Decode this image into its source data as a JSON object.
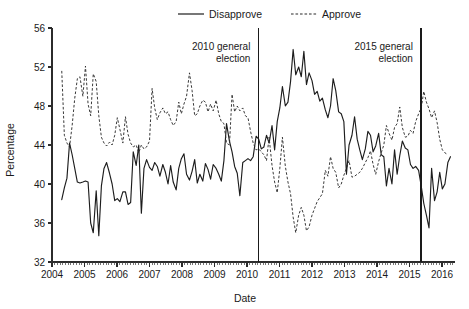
{
  "chart_data": {
    "type": "line",
    "title": "",
    "xlabel": "Date",
    "ylabel": "Percentage",
    "ylim": [
      32,
      56
    ],
    "ytick_step": 4,
    "yticks": [
      "32",
      "36",
      "40",
      "44",
      "48",
      "52",
      "56"
    ],
    "xlim": [
      2004,
      2016.4
    ],
    "xticks": [
      "2004",
      "2005",
      "2006",
      "2007",
      "2008",
      "2009",
      "2010",
      "2011",
      "2012",
      "2013",
      "2014",
      "2015",
      "2016"
    ],
    "grid": false,
    "legend_position": "top-center",
    "minor_ticks": "monthly",
    "annotations": [
      {
        "label_line1": "2010 general",
        "label_line2": "election",
        "x": 2010.35
      },
      {
        "label_line1": "2015 general",
        "label_line2": "election",
        "x": 2015.35
      }
    ],
    "series": [
      {
        "name": "Disapprove",
        "style": "solid",
        "color": "#1d1d1d",
        "x": [
          2004.3,
          2004.38,
          2004.46,
          2004.54,
          2004.62,
          2004.7,
          2004.78,
          2004.86,
          2004.95,
          2005.03,
          2005.11,
          2005.19,
          2005.27,
          2005.36,
          2005.44,
          2005.52,
          2005.6,
          2005.68,
          2005.77,
          2005.85,
          2005.93,
          2006.01,
          2006.09,
          2006.18,
          2006.26,
          2006.34,
          2006.42,
          2006.5,
          2006.59,
          2006.67,
          2006.75,
          2006.83,
          2006.91,
          2007.0,
          2007.08,
          2007.16,
          2007.24,
          2007.32,
          2007.41,
          2007.49,
          2007.57,
          2007.65,
          2007.73,
          2007.82,
          2007.9,
          2007.98,
          2008.06,
          2008.14,
          2008.23,
          2008.31,
          2008.39,
          2008.47,
          2008.55,
          2008.64,
          2008.72,
          2008.8,
          2008.88,
          2008.96,
          2009.05,
          2009.13,
          2009.21,
          2009.29,
          2009.37,
          2009.46,
          2009.54,
          2009.62,
          2009.7,
          2009.78,
          2009.87,
          2009.95,
          2010.03,
          2010.11,
          2010.19,
          2010.28,
          2010.36,
          2010.44,
          2010.52,
          2010.6,
          2010.68,
          2010.77,
          2010.85,
          2010.93,
          2011.01,
          2011.09,
          2011.18,
          2011.26,
          2011.34,
          2011.42,
          2011.5,
          2011.59,
          2011.67,
          2011.75,
          2011.83,
          2011.91,
          2012.0,
          2012.08,
          2012.16,
          2012.24,
          2012.32,
          2012.41,
          2012.49,
          2012.57,
          2012.65,
          2012.73,
          2012.82,
          2012.9,
          2012.98,
          2013.06,
          2013.14,
          2013.23,
          2013.31,
          2013.39,
          2013.47,
          2013.55,
          2013.64,
          2013.72,
          2013.8,
          2013.88,
          2013.96,
          2014.05,
          2014.13,
          2014.21,
          2014.29,
          2014.37,
          2014.46,
          2014.54,
          2014.62,
          2014.7,
          2014.78,
          2014.87,
          2014.95,
          2015.03,
          2015.11,
          2015.19,
          2015.28,
          2015.36,
          2015.44,
          2015.52,
          2015.6,
          2015.68,
          2015.77,
          2015.85,
          2015.93,
          2016.01,
          2016.09,
          2016.18,
          2016.26
        ],
        "y": [
          38.4,
          39.6,
          40.6,
          44.2,
          43.0,
          41.6,
          40.2,
          40.1,
          40.2,
          40.3,
          40.2,
          36.0,
          35.0,
          39.3,
          34.7,
          39.8,
          41.6,
          42.2,
          41.1,
          40.0,
          38.3,
          38.5,
          38.2,
          39.2,
          39.2,
          37.9,
          38.1,
          43.3,
          41.9,
          44.0,
          37.0,
          41.6,
          42.5,
          41.7,
          41.4,
          42.2,
          41.8,
          40.8,
          42.0,
          41.2,
          40.0,
          41.9,
          40.2,
          39.4,
          41.6,
          42.6,
          43.1,
          41.0,
          40.4,
          41.3,
          42.5,
          40.1,
          41.0,
          40.3,
          42.1,
          41.5,
          40.5,
          42.0,
          41.6,
          41.0,
          40.3,
          42.4,
          46.2,
          44.4,
          43.3,
          41.8,
          41.1,
          38.8,
          42.2,
          42.4,
          42.6,
          42.4,
          42.8,
          44.9,
          44.6,
          43.6,
          43.8,
          45.0,
          44.2,
          46.0,
          43.5,
          46.4,
          47.8,
          50.0,
          48.0,
          48.4,
          50.5,
          53.8,
          51.2,
          52.0,
          51.0,
          53.6,
          50.2,
          51.4,
          50.6,
          49.2,
          49.5,
          48.5,
          48.8,
          47.6,
          46.8,
          48.0,
          50.8,
          49.6,
          47.4,
          47.2,
          46.4,
          41.0,
          44.0,
          45.0,
          46.9,
          44.6,
          43.5,
          42.5,
          43.6,
          45.4,
          45.0,
          43.3,
          43.9,
          45.2,
          43.0,
          42.8,
          39.8,
          41.6,
          40.0,
          43.5,
          41.0,
          42.9,
          44.4,
          43.7,
          43.5,
          42.0,
          41.6,
          41.8,
          41.4,
          39.8,
          38.0,
          36.8,
          35.5,
          41.6,
          38.3,
          39.2,
          41.2,
          39.5,
          40.0,
          42.2,
          42.8
        ]
      },
      {
        "name": "Approve",
        "style": "dashed",
        "color": "#2e2e2e",
        "x": [
          2004.3,
          2004.38,
          2004.46,
          2004.54,
          2004.62,
          2004.7,
          2004.78,
          2004.86,
          2004.95,
          2005.03,
          2005.11,
          2005.19,
          2005.27,
          2005.36,
          2005.44,
          2005.52,
          2005.6,
          2005.68,
          2005.77,
          2005.85,
          2005.93,
          2006.01,
          2006.09,
          2006.18,
          2006.26,
          2006.34,
          2006.42,
          2006.5,
          2006.59,
          2006.67,
          2006.75,
          2006.83,
          2006.91,
          2007.0,
          2007.08,
          2007.16,
          2007.24,
          2007.32,
          2007.41,
          2007.49,
          2007.57,
          2007.65,
          2007.73,
          2007.82,
          2007.9,
          2007.98,
          2008.06,
          2008.14,
          2008.23,
          2008.31,
          2008.39,
          2008.47,
          2008.55,
          2008.64,
          2008.72,
          2008.8,
          2008.88,
          2008.96,
          2009.05,
          2009.13,
          2009.21,
          2009.29,
          2009.37,
          2009.46,
          2009.54,
          2009.62,
          2009.7,
          2009.78,
          2009.87,
          2009.95,
          2010.03,
          2010.11,
          2010.19,
          2010.28,
          2010.36,
          2010.44,
          2010.52,
          2010.6,
          2010.68,
          2010.77,
          2010.85,
          2010.93,
          2011.01,
          2011.09,
          2011.18,
          2011.26,
          2011.34,
          2011.42,
          2011.5,
          2011.59,
          2011.67,
          2011.75,
          2011.83,
          2011.91,
          2012.0,
          2012.08,
          2012.16,
          2012.24,
          2012.32,
          2012.41,
          2012.49,
          2012.57,
          2012.65,
          2012.73,
          2012.82,
          2012.9,
          2012.98,
          2013.06,
          2013.14,
          2013.23,
          2013.31,
          2013.39,
          2013.47,
          2013.55,
          2013.64,
          2013.72,
          2013.8,
          2013.88,
          2013.96,
          2014.05,
          2014.13,
          2014.21,
          2014.29,
          2014.37,
          2014.46,
          2014.54,
          2014.62,
          2014.7,
          2014.78,
          2014.87,
          2014.95,
          2015.03,
          2015.11,
          2015.19,
          2015.28,
          2015.36,
          2015.44,
          2015.52,
          2015.6,
          2015.68,
          2015.77,
          2015.85,
          2015.93,
          2016.01,
          2016.09,
          2016.18
        ],
        "y": [
          51.6,
          45.0,
          44.2,
          43.8,
          46.0,
          48.8,
          50.8,
          51.0,
          49.0,
          52.1,
          48.2,
          47.0,
          51.3,
          50.5,
          47.0,
          44.8,
          44.2,
          43.9,
          44.3,
          44.0,
          45.0,
          46.8,
          45.6,
          44.2,
          46.9,
          45.1,
          44.2,
          43.8,
          44.0,
          43.2,
          44.0,
          43.6,
          43.8,
          44.4,
          49.8,
          47.8,
          46.6,
          47.3,
          47.8,
          47.2,
          47.4,
          46.6,
          46.0,
          46.4,
          48.4,
          47.2,
          48.2,
          49.0,
          51.4,
          49.6,
          47.0,
          47.2,
          48.0,
          48.6,
          48.4,
          47.4,
          48.2,
          47.5,
          48.6,
          47.2,
          46.4,
          46.2,
          44.2,
          44.0,
          49.2,
          47.4,
          48.0,
          47.5,
          47.8,
          47.0,
          46.8,
          45.4,
          44.2,
          43.5,
          43.6,
          43.3,
          43.0,
          42.4,
          44.8,
          41.9,
          40.2,
          39.1,
          41.6,
          44.8,
          41.8,
          40.2,
          39.0,
          36.6,
          35.0,
          36.8,
          37.6,
          36.8,
          35.2,
          35.6,
          36.8,
          37.5,
          38.2,
          38.6,
          39.0,
          41.4,
          40.8,
          42.8,
          41.6,
          41.2,
          39.6,
          40.0,
          40.9,
          41.6,
          42.4,
          40.7,
          40.8,
          41.0,
          41.2,
          41.6,
          42.2,
          42.7,
          43.4,
          42.0,
          41.0,
          42.3,
          43.2,
          44.0,
          46.0,
          45.2,
          44.5,
          45.8,
          46.2,
          47.9,
          45.8,
          44.8,
          44.9,
          45.5,
          45.2,
          46.4,
          47.2,
          47.8,
          49.5,
          48.4,
          47.7,
          46.8,
          47.5,
          46.3,
          44.6,
          43.5,
          43.2,
          43.0
        ]
      }
    ]
  },
  "legend": {
    "items": [
      {
        "label": "Disapprove",
        "style": "solid"
      },
      {
        "label": "Approve",
        "style": "dashed"
      }
    ]
  }
}
